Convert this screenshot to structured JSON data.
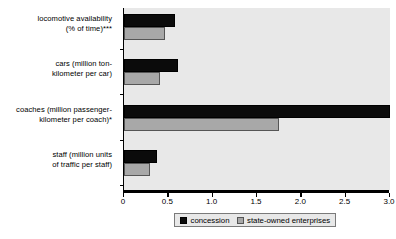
{
  "chart_data": {
    "type": "bar",
    "orientation": "horizontal",
    "title": "",
    "xlabel": "",
    "ylabel": "",
    "xlim": [
      0,
      3.0
    ],
    "xticks": [
      "0",
      "0.5",
      "1.0",
      "1.5",
      "2.0",
      "2.5",
      "3.0"
    ],
    "xtick_values": [
      0,
      0.5,
      1.0,
      1.5,
      2.0,
      2.5,
      3.0
    ],
    "grid": false,
    "legend_position": "bottom",
    "categories": [
      "locomotive availability (% of time)***",
      "cars (million ton-kilometer per car)",
      "coaches (million passenger-kilometer per coach)*",
      "staff (million units of traffic per staff)"
    ],
    "category_lines": [
      [
        "locomotive availability",
        "(% of time)***"
      ],
      [
        "cars (million ton-",
        "kilometer per car)"
      ],
      [
        "coaches (million passenger-",
        "kilometer per coach)*"
      ],
      [
        "staff (million units",
        "of traffic per staff)"
      ]
    ],
    "series": [
      {
        "name": "concession",
        "color": "#0b0b0b",
        "values": [
          0.57,
          0.61,
          3.0,
          0.37
        ]
      },
      {
        "name": "state-owned enterprises",
        "color": "#a8a8a8",
        "values": [
          0.46,
          0.41,
          1.75,
          0.29
        ]
      }
    ]
  },
  "legend": {
    "entries": [
      {
        "label": "concession"
      },
      {
        "label": "state-owned enterprises"
      }
    ]
  },
  "colors": {
    "concession": "#0b0b0b",
    "state_owned": "#a8a8a8",
    "plot_background": "#e8e8e8",
    "axis": "#000000"
  }
}
